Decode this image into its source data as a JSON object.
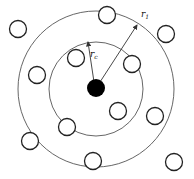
{
  "diagram": {
    "center_particle": {
      "cx": 96,
      "cy": 88,
      "r": 9,
      "fill": "#000000"
    },
    "inner_circle": {
      "cx": 96,
      "cy": 89,
      "r": 47,
      "label": "r",
      "label_sub": "c"
    },
    "outer_circle": {
      "cx": 96,
      "cy": 89,
      "r": 78,
      "label": "r",
      "label_sub": "1"
    },
    "neighbors": [
      {
        "cx": 18,
        "cy": 29
      },
      {
        "cx": 107,
        "cy": 15
      },
      {
        "cx": 166,
        "cy": 34
      },
      {
        "cx": 76,
        "cy": 58
      },
      {
        "cx": 132,
        "cy": 64
      },
      {
        "cx": 37,
        "cy": 75
      },
      {
        "cx": 118,
        "cy": 111
      },
      {
        "cx": 155,
        "cy": 116
      },
      {
        "cx": 67,
        "cy": 127
      },
      {
        "cx": 30,
        "cy": 141
      },
      {
        "cx": 93,
        "cy": 161
      },
      {
        "cx": 174,
        "cy": 162
      }
    ],
    "neighbor_radius": 8.5,
    "arrows": [
      {
        "name": "rc",
        "x1": 94,
        "y1": 82,
        "x2": 88,
        "y2": 42
      },
      {
        "name": "r1",
        "x1": 100,
        "y1": 82,
        "x2": 137,
        "y2": 25
      }
    ]
  }
}
